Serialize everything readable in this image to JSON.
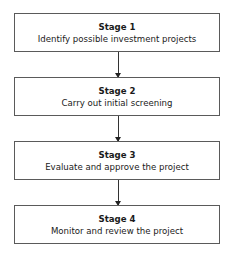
{
  "diagram": {
    "type": "flowchart",
    "stages": [
      {
        "title": "Stage 1",
        "description": "Identify possible investment projects"
      },
      {
        "title": "Stage 2",
        "description": "Carry out initial screening"
      },
      {
        "title": "Stage 3",
        "description": "Evaluate and approve the project"
      },
      {
        "title": "Stage 4",
        "description": "Monitor and review the project"
      }
    ],
    "connections": [
      {
        "from": "Stage 1",
        "to": "Stage 2"
      },
      {
        "from": "Stage 2",
        "to": "Stage 3"
      },
      {
        "from": "Stage 3",
        "to": "Stage 4"
      }
    ]
  }
}
